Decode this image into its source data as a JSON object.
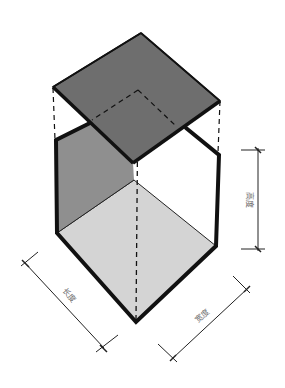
{
  "diagram": {
    "type": "isometric-box-dimensions",
    "labels": {
      "height": "高度",
      "length": "长度",
      "width": "宽度"
    },
    "colors": {
      "top_plane": "#6e6e6e",
      "left_wall": "#8f8f8f",
      "floor": "#d4d4d4",
      "outline": "#111111",
      "dimension_line": "#222222",
      "label": "#6a6a6a"
    }
  }
}
